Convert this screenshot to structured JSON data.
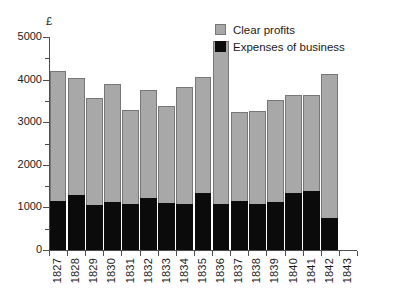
{
  "chart_data": {
    "type": "bar",
    "title": "",
    "subtitle": "",
    "xlabel": "",
    "ylabel": "£",
    "stacked": true,
    "grid": false,
    "legend_position": "top-right",
    "ylim": [
      0,
      5000
    ],
    "yticks": [
      0,
      1000,
      2000,
      3000,
      4000,
      5000
    ],
    "ytick_labels": [
      "0",
      "1000",
      "2000",
      "3000",
      "4000",
      "5000"
    ],
    "yticks_minor": [
      500,
      1500,
      2500,
      3500,
      4500
    ],
    "categories": [
      "1827",
      "1828",
      "1829",
      "1830",
      "1831",
      "1832",
      "1833",
      "1834",
      "1835",
      "1836",
      "1837",
      "1838",
      "1839",
      "1840",
      "1841",
      "1842",
      "1843"
    ],
    "series": [
      {
        "name": "Expenses of business",
        "color": "#0b0b0b",
        "values": [
          1160,
          1300,
          1060,
          1120,
          1080,
          1210,
          1110,
          1070,
          1330,
          1090,
          1150,
          1090,
          1120,
          1330,
          1380,
          750,
          null
        ]
      },
      {
        "name": "Clear profits",
        "color": "#a8a8a8",
        "values": [
          3040,
          2730,
          2510,
          2780,
          2200,
          2540,
          2270,
          2760,
          2720,
          3810,
          2080,
          2180,
          2390,
          2300,
          2250,
          3380,
          null
        ]
      }
    ],
    "totals": [
      4200,
      4030,
      3570,
      3900,
      3280,
      3750,
      3380,
      3830,
      4050,
      4900,
      3230,
      3270,
      3510,
      3630,
      3630,
      4130,
      null
    ]
  },
  "legend": {
    "items": [
      {
        "label": "Clear profits",
        "swatch": "profit-swatch"
      },
      {
        "label": "Expenses of business",
        "swatch": "expense-swatch"
      }
    ]
  }
}
